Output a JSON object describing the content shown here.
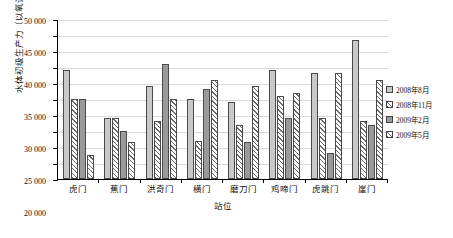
{
  "chart_data": {
    "type": "bar",
    "title": "",
    "xlabel": "站位",
    "ylabel": "水体初级生产力（以氧计，mg/m³）",
    "ylim": [
      0,
      50000
    ],
    "ytick_step": 5000,
    "grid": true,
    "legend_position": "right",
    "categories": [
      "虎门",
      "蕉门",
      "洪奇门",
      "横门",
      "磨刀门",
      "鸡啼门",
      "虎跳门",
      "崖门"
    ],
    "series": [
      {
        "name": "2008年8月",
        "pattern": "solid-light-gray",
        "color": "#c9c9c9",
        "values": [
          34000,
          19200,
          29000,
          25000,
          24000,
          34000,
          33000,
          43500
        ]
      },
      {
        "name": "2008年11月",
        "pattern": "diagonal-hatch",
        "color": "#6a6a6a",
        "values": [
          25000,
          19000,
          18000,
          12000,
          17000,
          26000,
          19000,
          18000
        ]
      },
      {
        "name": "2009年2月",
        "pattern": "solid-dark-gray",
        "color": "#9a9a9a",
        "values": [
          25000,
          15000,
          36000,
          28000,
          11500,
          19000,
          8000,
          17000
        ]
      },
      {
        "name": "2009年5月",
        "pattern": "diagonal-hatch",
        "color": "#6a6a6a",
        "values": [
          7500,
          11500,
          25000,
          31000,
          29000,
          27000,
          33000,
          31000
        ]
      }
    ],
    "ytick_labels": [
      "0",
      "5 000",
      "10 000",
      "15 000",
      "20 000",
      "25 000",
      "30 000",
      "35 000",
      "40 000",
      "45 000",
      "50 000"
    ]
  }
}
